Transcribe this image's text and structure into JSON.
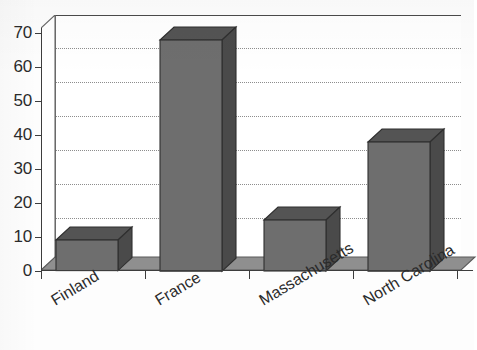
{
  "chart_data": {
    "type": "bar",
    "title": "",
    "subtitle": "",
    "xlabel": "",
    "ylabel": "",
    "categories": [
      "Finland",
      "France",
      "Massachusetts",
      "North Carolina"
    ],
    "values": [
      9,
      68,
      15,
      38
    ],
    "ylim": [
      0,
      70
    ],
    "y_ticks": [
      0,
      10,
      20,
      30,
      40,
      50,
      60,
      70
    ],
    "y_tick_labels": [
      "0",
      "10",
      "20",
      "30",
      "40",
      "50",
      "60",
      "70"
    ],
    "grid": "horizontal-dotted",
    "legend": "none",
    "style": "3d-grayscale",
    "series": [
      {
        "name": "",
        "values": [
          9,
          68,
          15,
          38
        ]
      }
    ],
    "bar_color_front": "#6e6e6e",
    "bar_color_top": "#545454",
    "bar_color_side": "#4a4a4a",
    "grid_color": "#8d8d8d",
    "axis_color": "#3d3d3d",
    "background_color": "#ffffff",
    "floor_color": "#8f8f8f"
  },
  "axis": {
    "y_labels": [
      "70",
      "60",
      "50",
      "40",
      "30",
      "20",
      "10",
      "0"
    ]
  },
  "x_axis": {
    "labels": [
      "Finland",
      "France",
      "Massachusetts",
      "North Carolina"
    ]
  }
}
